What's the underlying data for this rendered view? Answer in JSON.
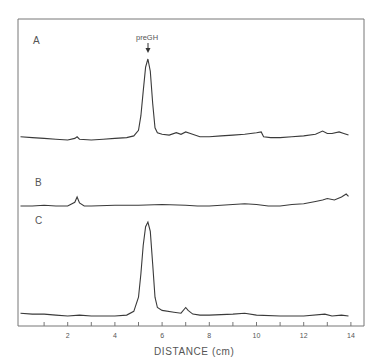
{
  "chart_data": {
    "type": "line",
    "title": "",
    "xlabel": "DISTANCE (cm)",
    "ylabel": "",
    "xlim": [
      0,
      14
    ],
    "x_ticks": [
      2,
      4,
      6,
      8,
      10,
      12,
      14
    ],
    "x_minor_ticks": [
      1,
      3,
      5,
      7,
      9,
      11,
      13
    ],
    "grid": false,
    "legend": null,
    "annotations": [
      {
        "text": "preGH",
        "x": 5.4,
        "series": "A",
        "type": "arrow-down"
      }
    ],
    "series": [
      {
        "name": "A",
        "x": [
          0,
          0.5,
          1.0,
          1.5,
          2.0,
          2.3,
          2.4,
          2.5,
          3.0,
          3.5,
          4.0,
          4.5,
          4.8,
          5.0,
          5.1,
          5.2,
          5.3,
          5.4,
          5.5,
          5.6,
          5.7,
          5.8,
          6.0,
          6.3,
          6.6,
          6.8,
          7.0,
          7.2,
          7.6,
          8.0,
          8.5,
          9.0,
          9.5,
          10.0,
          10.2,
          10.3,
          10.6,
          11.0,
          11.5,
          12.0,
          12.5,
          12.8,
          13.0,
          13.2,
          13.5,
          13.7,
          13.9
        ],
        "y": [
          0.04,
          0.03,
          0.02,
          0.01,
          0.0,
          0.02,
          0.04,
          0.01,
          0.0,
          0.01,
          0.02,
          0.03,
          0.05,
          0.12,
          0.3,
          0.6,
          0.9,
          1.0,
          0.85,
          0.45,
          0.15,
          0.09,
          0.07,
          0.06,
          0.09,
          0.07,
          0.1,
          0.08,
          0.04,
          0.04,
          0.05,
          0.06,
          0.07,
          0.09,
          0.1,
          0.04,
          0.03,
          0.03,
          0.04,
          0.05,
          0.07,
          0.11,
          0.08,
          0.08,
          0.1,
          0.08,
          0.06
        ]
      },
      {
        "name": "B",
        "x": [
          0,
          0.5,
          1.0,
          1.5,
          2.0,
          2.3,
          2.4,
          2.5,
          2.7,
          3.0,
          4.0,
          5.0,
          6.0,
          7.0,
          7.5,
          8.0,
          9.0,
          9.5,
          10.0,
          10.5,
          11.0,
          11.5,
          12.0,
          12.5,
          12.8,
          13.0,
          13.3,
          13.6,
          13.8,
          13.9
        ],
        "y": [
          0.0,
          0.0,
          0.01,
          0.0,
          0.0,
          0.05,
          0.12,
          0.04,
          0.0,
          0.0,
          0.01,
          0.01,
          0.02,
          0.01,
          0.0,
          0.0,
          0.02,
          0.03,
          0.02,
          0.0,
          0.0,
          0.02,
          0.03,
          0.06,
          0.08,
          0.1,
          0.08,
          0.12,
          0.16,
          0.13
        ]
      },
      {
        "name": "C",
        "x": [
          0,
          0.5,
          1.0,
          1.5,
          2.0,
          2.5,
          3.0,
          3.5,
          4.0,
          4.5,
          4.8,
          5.0,
          5.1,
          5.2,
          5.3,
          5.4,
          5.5,
          5.6,
          5.7,
          5.8,
          6.0,
          6.5,
          6.8,
          7.0,
          7.1,
          7.3,
          7.6,
          8.0,
          9.0,
          9.5,
          10.0,
          11.0,
          12.0,
          12.9,
          13.2,
          13.6,
          13.9
        ],
        "y": [
          0.03,
          0.02,
          0.02,
          0.01,
          0.0,
          0.01,
          0.0,
          0.0,
          0.0,
          0.01,
          0.05,
          0.2,
          0.45,
          0.75,
          0.95,
          1.0,
          0.9,
          0.55,
          0.2,
          0.09,
          0.06,
          0.04,
          0.03,
          0.09,
          0.06,
          0.02,
          0.01,
          0.01,
          0.02,
          0.03,
          0.01,
          0.0,
          0.0,
          0.02,
          0.0,
          0.01,
          0.0
        ]
      }
    ]
  },
  "labels": {
    "trace_a": "A",
    "trace_b": "B",
    "trace_c": "C",
    "annotation": "preGH",
    "xlabel": "DISTANCE (cm)",
    "ticks": [
      "2",
      "4",
      "6",
      "8",
      "10",
      "12",
      "14"
    ]
  },
  "colors": {
    "line": "#3a3a3a",
    "frame": "#6a6a6a",
    "text": "#555555"
  }
}
